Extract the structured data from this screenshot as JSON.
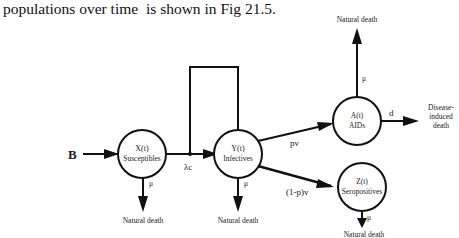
{
  "caption": "populations over time  is shown in Fig 21.5.",
  "nodes": {
    "susceptibles": {
      "line1": "X(t)",
      "line2": "Susceptibles"
    },
    "infectives": {
      "line1": "Y(t)",
      "line2": "Infectives"
    },
    "aids": {
      "line1": "A(t)",
      "line2": "AIDs"
    },
    "seropositives": {
      "line1": "Z(t)",
      "line2": "Seropositives"
    }
  },
  "edges": {
    "birth": "B",
    "infection_rate": "λc",
    "to_aids": "pv",
    "to_seropositives": "(1-p)v",
    "disease_death_rate": "d",
    "mu_susceptibles": "μ",
    "mu_infectives": "μ",
    "mu_aids": "μ",
    "mu_seropositives": "μ"
  },
  "outcomes": {
    "natural_death_susceptibles": "Natural death",
    "natural_death_infectives": "Natural death",
    "natural_death_aids": "Natural death",
    "natural_death_seropositives": "Natural death",
    "disease_death_line1": "Disease-",
    "disease_death_line2": "induced",
    "disease_death_line3": "death"
  }
}
